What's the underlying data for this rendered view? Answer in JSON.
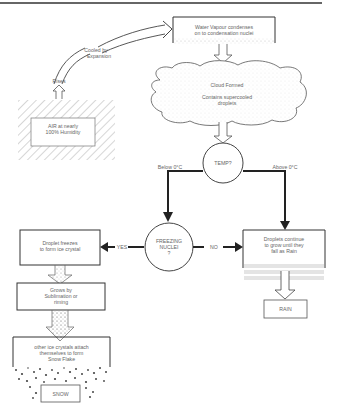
{
  "diagram": {
    "type": "flowchart",
    "topic": "Formation of rain and snow",
    "nodes": {
      "air": {
        "text": "AIR at nearly 100% Humidity",
        "line1": "AIR at nearly",
        "line2": "100% Humidity"
      },
      "rises": {
        "text": "Rises"
      },
      "cooled": {
        "line1": "Cooled by",
        "line2": "Expansion"
      },
      "vapour": {
        "line1": "Water Vapour condenses",
        "line2": "on to condensation nuclei"
      },
      "cloud": {
        "title": "Cloud Formed",
        "line1": "Contains supercooled",
        "line2": "droplets"
      },
      "temp": {
        "text": "TEMP?"
      },
      "below": {
        "text": "Below 0°C"
      },
      "above": {
        "text": "Above 0°C"
      },
      "freezing": {
        "line1": "FREEZING",
        "line2": "NUCLEI",
        "line3": "?"
      },
      "yes": {
        "text": "YES"
      },
      "no": {
        "text": "NO"
      },
      "freezes": {
        "line1": "Droplet freezes",
        "line2": "to form ice crystal"
      },
      "grows": {
        "line1": "Grows by",
        "line2": "Sublimation or",
        "line3": "riming"
      },
      "attach": {
        "line1": "other ice crystals attach",
        "line2": "themselves to form",
        "line3": "Snow Flake"
      },
      "snow": {
        "text": "SNOW"
      },
      "continue": {
        "line1": "Droplets continue",
        "line2": "to grow until they",
        "line3": "fall as Rain"
      },
      "rain": {
        "text": "RAIN"
      }
    },
    "edges": [
      {
        "from": "air",
        "to": "rises"
      },
      {
        "from": "rises",
        "to": "cooled"
      },
      {
        "from": "cooled",
        "to": "vapour"
      },
      {
        "from": "vapour",
        "to": "cloud"
      },
      {
        "from": "cloud",
        "to": "temp"
      },
      {
        "from": "temp",
        "to": "freezing",
        "label": "Below 0°C"
      },
      {
        "from": "temp",
        "to": "continue",
        "label": "Above 0°C"
      },
      {
        "from": "freezing",
        "to": "freezes",
        "label": "YES"
      },
      {
        "from": "freezing",
        "to": "continue",
        "label": "NO"
      },
      {
        "from": "freezes",
        "to": "grows"
      },
      {
        "from": "grows",
        "to": "attach"
      },
      {
        "from": "attach",
        "to": "snow"
      },
      {
        "from": "continue",
        "to": "rain"
      }
    ]
  }
}
